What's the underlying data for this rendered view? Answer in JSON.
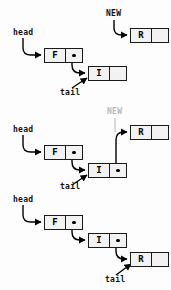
{
  "diagram": {
    "node_label_head": "head",
    "node_label_tail": "tail",
    "node_label_new": "NEW",
    "colors": {
      "stroke": "#000000",
      "node_fill": "#f2f2f2",
      "dim": "#b9b9b9",
      "background": "#fdfdfd"
    },
    "panels": [
      {
        "id": "panel-1",
        "caption": "",
        "labels": [
          {
            "name": "head",
            "text": "head",
            "dim": false
          },
          {
            "name": "new",
            "text": "NEW",
            "dim": false
          },
          {
            "name": "tail",
            "text": "tail",
            "dim": false
          }
        ],
        "nodes": [
          {
            "name": "node-f",
            "data": "F",
            "pointer_filled": true
          },
          {
            "name": "node-i",
            "data": "I",
            "pointer_filled": false
          },
          {
            "name": "node-r",
            "data": "R",
            "pointer_filled": false
          }
        ]
      },
      {
        "id": "panel-2",
        "caption": "",
        "labels": [
          {
            "name": "head",
            "text": "head",
            "dim": false
          },
          {
            "name": "new",
            "text": "NEW",
            "dim": true
          },
          {
            "name": "tail",
            "text": "tail",
            "dim": false
          }
        ],
        "nodes": [
          {
            "name": "node-f",
            "data": "F",
            "pointer_filled": true
          },
          {
            "name": "node-i",
            "data": "I",
            "pointer_filled": true
          },
          {
            "name": "node-r",
            "data": "R",
            "pointer_filled": false
          }
        ]
      },
      {
        "id": "panel-3",
        "caption": "",
        "labels": [
          {
            "name": "head",
            "text": "head",
            "dim": false
          },
          {
            "name": "tail",
            "text": "tail",
            "dim": false
          }
        ],
        "nodes": [
          {
            "name": "node-f",
            "data": "F",
            "pointer_filled": true
          },
          {
            "name": "node-i",
            "data": "I",
            "pointer_filled": true
          },
          {
            "name": "node-r",
            "data": "R",
            "pointer_filled": false
          }
        ]
      }
    ]
  }
}
